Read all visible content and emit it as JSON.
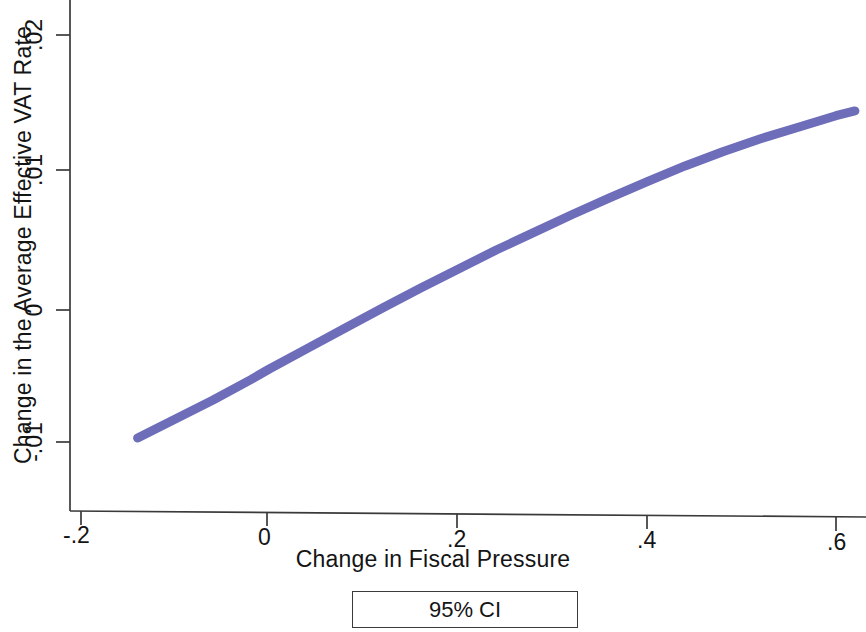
{
  "chart_data": {
    "type": "line",
    "title": "",
    "subtitle": "",
    "xlabel": "Change in Fiscal Pressure",
    "ylabel": "Change in the Average Effective VAT Rate",
    "xlim": [
      -0.2,
      0.65
    ],
    "ylim": [
      -0.012,
      0.0215
    ],
    "xticks": [
      -0.2,
      0,
      0.2,
      0.4,
      0.6
    ],
    "xtick_labels": [
      "-.2",
      "0",
      ".2",
      ".4",
      ".6"
    ],
    "yticks": [
      -0.01,
      0,
      0.01,
      0.02
    ],
    "ytick_labels": [
      "-.01",
      "0",
      ".01",
      ".02"
    ],
    "grid": false,
    "legend_position": "below-axis-centered",
    "legend_entries": [
      "95% CI"
    ],
    "series": [
      {
        "name": "95% CI",
        "kind": "confidence-band",
        "color": "#6d6dba",
        "x": [
          -0.14,
          -0.1,
          -0.06,
          -0.02,
          0.0,
          0.04,
          0.08,
          0.12,
          0.16,
          0.2,
          0.24,
          0.28,
          0.32,
          0.36,
          0.4,
          0.44,
          0.48,
          0.52,
          0.56,
          0.6,
          0.62
        ],
        "values": [
          -0.0097,
          -0.0083,
          -0.0069,
          -0.0054,
          -0.0046,
          -0.0031,
          -0.0016,
          -0.0001,
          0.00135,
          0.00275,
          0.00415,
          0.00545,
          0.00675,
          0.008,
          0.0092,
          0.01035,
          0.0114,
          0.01235,
          0.0132,
          0.01405,
          0.0144
        ]
      }
    ]
  },
  "axes": {
    "x_title": "Change in Fiscal Pressure",
    "y_title": "Change in the Average Effective VAT Rate"
  },
  "legend": {
    "ci_label": "95% CI"
  },
  "colors": {
    "curve": "#6d6dba",
    "axis": "#3a3a3a",
    "text": "#141414"
  }
}
